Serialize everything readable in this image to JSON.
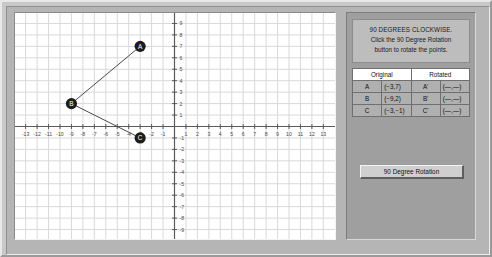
{
  "instructions": {
    "title": "90 DEGREES CLOCKWISE.",
    "line2": "Click the 90 Degree Rotation",
    "line3": "button to rotate the points."
  },
  "table": {
    "headers": [
      "Original",
      "Rotated"
    ],
    "rows": [
      {
        "label": "A",
        "original": "(−3,7)",
        "rotated_label": "A'",
        "rotated": "(—,—)"
      },
      {
        "label": "B",
        "original": "(−9,2)",
        "rotated_label": "B'",
        "rotated": "(—,—)"
      },
      {
        "label": "C",
        "original": "(−3,−1)",
        "rotated_label": "C'",
        "rotated": "(—,—)"
      }
    ]
  },
  "button": {
    "label": "90 Degree Rotation"
  },
  "chart_data": {
    "type": "scatter",
    "title": "",
    "xlabel": "",
    "ylabel": "",
    "xlim": [
      -13.8,
      13.8
    ],
    "ylim": [
      -9.6,
      9.6
    ],
    "grid": true,
    "legend": "none",
    "x_ticks": [
      -13,
      -12,
      -11,
      -10,
      -9,
      -8,
      -7,
      -6,
      -5,
      -4,
      -3,
      -2,
      -1,
      1,
      2,
      3,
      4,
      5,
      6,
      7,
      8,
      9,
      10,
      11,
      12,
      13
    ],
    "y_ticks": [
      -9,
      -8,
      -7,
      -6,
      -5,
      -4,
      -3,
      -2,
      -1,
      1,
      2,
      3,
      4,
      5,
      6,
      7,
      8,
      9
    ],
    "points": [
      {
        "name": "A",
        "x": -3,
        "y": 7
      },
      {
        "name": "B",
        "x": -9,
        "y": 2
      },
      {
        "name": "C",
        "x": -3,
        "y": -1
      }
    ],
    "segments": [
      [
        "A",
        "B"
      ],
      [
        "B",
        "C"
      ]
    ],
    "point_color": "#1d1d1d",
    "point_label_color": "#ffffff",
    "line_color": "#4a4a4a",
    "grid_color": "#d9d9d9",
    "axis_color": "#5a5a5a"
  }
}
